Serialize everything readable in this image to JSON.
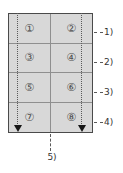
{
  "figure": {
    "grid": {
      "rows": 4,
      "cols": 2,
      "cells": [
        "①",
        "②",
        "③",
        "④",
        "⑤",
        "⑥",
        "⑦",
        "⑧"
      ]
    },
    "callouts": {
      "rows": [
        "1)",
        "2)",
        "3)",
        "4)"
      ],
      "center": "5)"
    },
    "icons": {
      "left_arrow": "down-arrow-icon",
      "right_arrow": "down-arrow-icon"
    },
    "colors": {
      "cell_fill": "#d8d8d8",
      "outer_border": "#4a4a4a",
      "inner_line": "#8f8f8f",
      "guide_line": "#5a5a5a",
      "arrow": "#161616",
      "label_text": "#333333",
      "background": "#ffffff"
    }
  }
}
